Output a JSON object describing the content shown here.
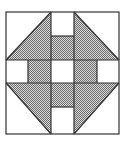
{
  "diagram": {
    "name": "quilt-block",
    "pattern": "churn-dash",
    "colors": {
      "line": "#333333",
      "background": "#ffffff",
      "shade_light": "#e6e6e6",
      "shade_dark": "#7a7a7a"
    },
    "outer": {
      "x": 6,
      "y": 12,
      "w": 113,
      "h": 122
    },
    "grid": {
      "x1": 51,
      "x2": 74,
      "y1": 60,
      "y2": 83,
      "inner_left": 28,
      "inner_right": 97,
      "inner_top": 36,
      "inner_bottom": 107
    }
  }
}
